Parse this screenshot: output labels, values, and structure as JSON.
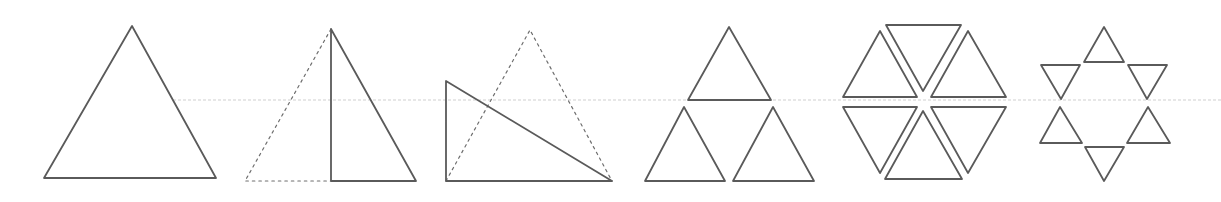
{
  "title": "Equilateral triangle constructions",
  "colors": {
    "line": "#5a5a5a",
    "dashed": "#6e6e6e",
    "guide": "#cfcfcf",
    "background": "#ffffff"
  },
  "guide_line": {
    "y": 100,
    "x_start": 173,
    "x_end": 1221
  },
  "figures": [
    {
      "id": "fig-1",
      "label": "equilateral triangle"
    },
    {
      "id": "fig-2",
      "label": "equilateral triangle bisected by altitude, right half solid"
    },
    {
      "id": "fig-3",
      "label": "right triangle overlapping dashed equilateral triangle"
    },
    {
      "id": "fig-4",
      "label": "three triangles arranged in a triangle"
    },
    {
      "id": "fig-5",
      "label": "six triangles forming a hexagon"
    },
    {
      "id": "fig-6",
      "label": "six small triangles forming a star"
    }
  ]
}
